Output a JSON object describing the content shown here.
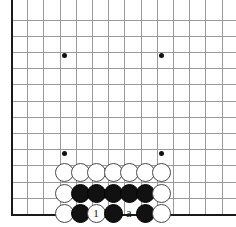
{
  "board": {
    "kind": "go-board-diagram",
    "line_color": "#9a9a9a",
    "edge_color": "#1a1a1a",
    "background": "#ffffff",
    "grid": {
      "origin_x": 11,
      "origin_y": 8,
      "spacing": 16.2,
      "cols": 14,
      "rows": 13,
      "bottom_edge_y": 214,
      "left_edge_x": 11
    },
    "hoshi": [
      {
        "x": 64,
        "y": 55
      },
      {
        "x": 161,
        "y": 55
      },
      {
        "x": 64,
        "y": 153
      },
      {
        "x": 161,
        "y": 153
      }
    ]
  },
  "stones": [
    {
      "color": "white",
      "x": 64,
      "y": 172,
      "marker": ""
    },
    {
      "color": "white",
      "x": 80,
      "y": 172,
      "marker": ""
    },
    {
      "color": "white",
      "x": 96,
      "y": 172,
      "marker": ""
    },
    {
      "color": "white",
      "x": 113,
      "y": 172,
      "marker": ""
    },
    {
      "color": "white",
      "x": 129,
      "y": 172,
      "marker": ""
    },
    {
      "color": "white",
      "x": 145,
      "y": 172,
      "marker": ""
    },
    {
      "color": "white",
      "x": 161,
      "y": 172,
      "marker": ""
    },
    {
      "color": "white",
      "x": 64,
      "y": 193,
      "marker": ""
    },
    {
      "color": "black",
      "x": 80,
      "y": 193,
      "marker": ""
    },
    {
      "color": "black",
      "x": 96,
      "y": 193,
      "marker": ""
    },
    {
      "color": "black",
      "x": 113,
      "y": 193,
      "marker": ""
    },
    {
      "color": "black",
      "x": 129,
      "y": 193,
      "marker": ""
    },
    {
      "color": "black",
      "x": 145,
      "y": 193,
      "marker": ""
    },
    {
      "color": "white",
      "x": 161,
      "y": 193,
      "marker": ""
    },
    {
      "color": "white",
      "x": 64,
      "y": 213,
      "marker": ""
    },
    {
      "color": "black",
      "x": 80,
      "y": 213,
      "marker": ""
    },
    {
      "color": "white",
      "x": 96,
      "y": 213,
      "marker": "1"
    },
    {
      "color": "black",
      "x": 113,
      "y": 213,
      "marker": ""
    },
    {
      "color": "black",
      "x": 145,
      "y": 213,
      "marker": ""
    },
    {
      "color": "white",
      "x": 161,
      "y": 213,
      "marker": ""
    }
  ],
  "point_labels": [
    {
      "text": "a",
      "x": 129,
      "y": 213
    }
  ]
}
